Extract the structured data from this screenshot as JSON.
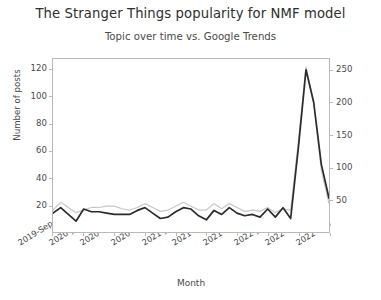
{
  "chart_data": {
    "type": "line",
    "title": "The Stranger Things popularity for NMF model",
    "subtitle": "Topic over time vs. Google Trends",
    "xlabel": "Month",
    "ylabel": "Number of posts",
    "ylabel_right": "",
    "grid": false,
    "legend": "none",
    "ylim": [
      0,
      128
    ],
    "ylim_right": [
      0,
      268
    ],
    "yticks": [
      20,
      40,
      60,
      80,
      100,
      120
    ],
    "yticks_right": [
      50,
      100,
      150,
      200,
      250
    ],
    "x": [
      "2019-Sep",
      "2019-Oct",
      "2019-Nov",
      "2019-Dec",
      "2020-Jan",
      "2020-Feb",
      "2020-Mar",
      "2020-Apr",
      "2020-May",
      "2020-Jun",
      "2020-Jul",
      "2020-Aug",
      "2020-Sep",
      "2020-Oct",
      "2020-Nov",
      "2020-Dec",
      "2021-Jan",
      "2021-Feb",
      "2021-Mar",
      "2021-Apr",
      "2021-May",
      "2021-Jun",
      "2021-Jul",
      "2021-Aug",
      "2021-Sep",
      "2021-Oct",
      "2021-Nov",
      "2021-Dec",
      "2022-Jan",
      "2022-Feb",
      "2022-Mar",
      "2022-Apr",
      "2022-May",
      "2022-Jun",
      "2022-Jul",
      "2022-Aug",
      "2022-Sep"
    ],
    "xtick_labels": [
      "2019-Sep",
      "2020-Jan",
      "2020-May",
      "2020-Sep",
      "2021-Jan",
      "2021-May",
      "2021-Sep",
      "2022-Jan",
      "2022-May",
      "2022-Sep"
    ],
    "xtick_indices": [
      0,
      4,
      8,
      12,
      16,
      20,
      24,
      28,
      32,
      36
    ],
    "series": [
      {
        "name": "Number of posts",
        "axis": "left",
        "color": "#2b2b2b",
        "values": [
          14,
          18,
          13,
          8,
          17,
          15,
          15,
          14,
          13,
          13,
          13,
          16,
          18,
          14,
          10,
          11,
          15,
          18,
          17,
          12,
          9,
          16,
          13,
          18,
          14,
          12,
          13,
          11,
          17,
          11,
          18,
          10,
          62,
          120,
          96,
          50,
          25
        ]
      },
      {
        "name": "Google Trends",
        "axis": "right",
        "color": "#c7c7c7",
        "values": [
          34,
          46,
          38,
          30,
          34,
          38,
          38,
          40,
          40,
          36,
          34,
          38,
          44,
          38,
          32,
          34,
          40,
          46,
          40,
          34,
          34,
          44,
          36,
          44,
          38,
          32,
          34,
          32,
          38,
          30,
          36,
          34,
          140,
          256,
          200,
          96,
          44
        ]
      }
    ]
  }
}
